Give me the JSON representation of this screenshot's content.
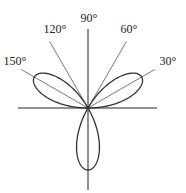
{
  "diagram": {
    "type": "polar-rose",
    "equation_hint": "three-petal rose r = sin(3θ)",
    "origin": [
      88,
      108
    ],
    "petal_radius_px": 62,
    "petal_directions_deg": [
      30,
      150,
      270
    ],
    "axes": {
      "horizontal": {
        "x1": 18,
        "x2": 157
      },
      "vertical": {
        "y1": 29,
        "y2": 190
      }
    },
    "rays": [
      {
        "angle": 30,
        "label": "30°",
        "label_pos": [
          168,
          65
        ]
      },
      {
        "angle": 60,
        "label": "60°",
        "label_pos": [
          129,
          33
        ]
      },
      {
        "angle": 90,
        "label": "90°",
        "label_pos": [
          89,
          22
        ]
      },
      {
        "angle": 120,
        "label": "120°",
        "label_pos": [
          55,
          33
        ]
      },
      {
        "angle": 150,
        "label": "150°",
        "label_pos": [
          15,
          65
        ]
      }
    ],
    "ray_length_px": 77,
    "colors": {
      "curve": "#333333",
      "axis": "#222222",
      "ray": "#555555",
      "text": "#222222"
    }
  }
}
